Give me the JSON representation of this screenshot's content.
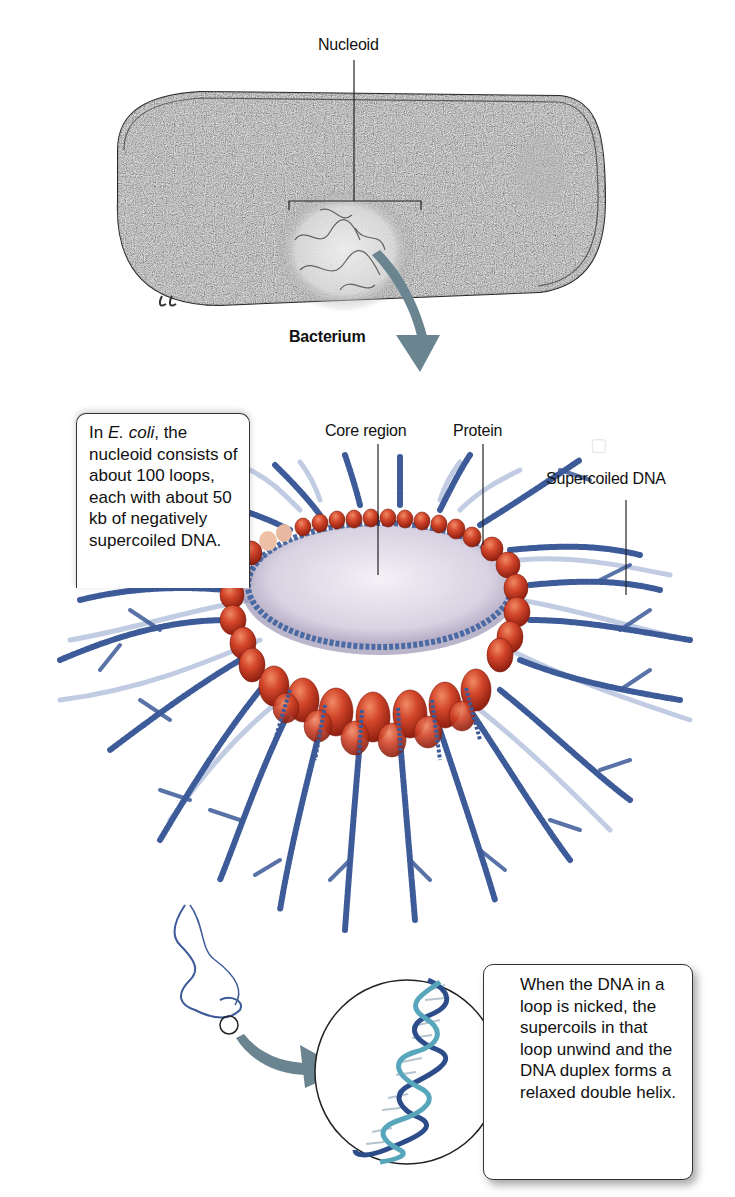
{
  "figure": {
    "type": "biology textbook diagram"
  },
  "top_panel": {
    "bacterium_label": "Bacterium",
    "nucleoid_label": "Nucleoid"
  },
  "middle_panel": {
    "labels": {
      "core_region": "Core region",
      "protein": "Protein",
      "supercoiled_dna": "Supercoiled DNA"
    },
    "callout": {
      "prefix": "In ",
      "species_italic": "E. coli",
      "text": ", the nucleoid consists of about 100 loops, each with about 50 kb of negatively supercoiled DNA."
    }
  },
  "bottom_panel": {
    "callout_text": "When the DNA in a loop is nicked, the supercoils in that loop unwind and the DNA duplex forms a relaxed double helix."
  },
  "colors": {
    "arrow": "#6b8590",
    "protein": "#c8361e",
    "dna": "#3d5a99",
    "core": "#d9d3e3",
    "cell": "#8a8a8a"
  },
  "facts": {
    "loop_count": "about 100",
    "kb_per_loop": "about 50 kb"
  }
}
